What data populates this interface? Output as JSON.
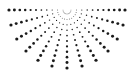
{
  "graphic": {
    "name": "dotted-half-sunburst",
    "color": "#1a1a1a",
    "background": "#ffffff",
    "center": [
      67,
      10
    ],
    "ray_count": 13,
    "start_angle_deg": 0,
    "end_angle_deg": 180,
    "dots_per_ray": 11,
    "inner_radius": 4,
    "outer_radius": 58,
    "min_dot_radius": 0.35,
    "max_dot_radius": 1.6
  }
}
